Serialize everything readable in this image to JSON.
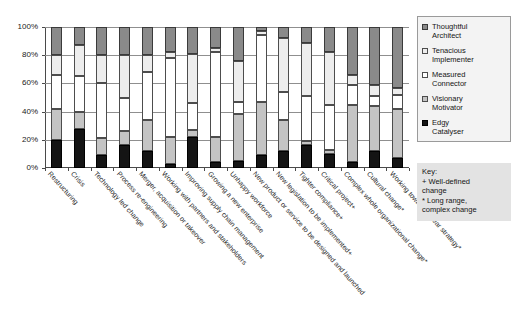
{
  "chart_data": {
    "type": "bar",
    "stacked": true,
    "normalized_percent": true,
    "title": "",
    "xlabel": "",
    "ylabel": "",
    "ylim": [
      0,
      100
    ],
    "ytick_labels": [
      "0%",
      "20%",
      "40%",
      "60%",
      "80%",
      "100%"
    ],
    "ytick_values": [
      0,
      20,
      40,
      60,
      80,
      100
    ],
    "grid": true,
    "legend_position": "right",
    "categories": [
      "Restructuring",
      "Crisis",
      "Technology led change",
      "Process re-engineering",
      "Merger, acquisition or takeover",
      "Working with partners and stakeholders",
      "Improving supply chain management",
      "Growing a new enterprise",
      "Unhappy workforce",
      "New product or service to be designed and launched",
      "New legislation to be implemented+",
      "Tighter compliance+",
      "Critical project+",
      "Complex whole organizational change*",
      "Cultural change*",
      "Working towards 5 year strategy*"
    ],
    "series": [
      {
        "name": "Edgy Catalyser",
        "color": "#141414",
        "values": [
          20,
          28,
          9,
          16,
          12,
          3,
          22,
          4,
          5,
          9,
          12,
          16,
          10,
          4,
          12,
          7
        ]
      },
      {
        "name": "Visionary Motivator",
        "color": "#c4c4c4",
        "values": [
          22,
          12,
          12,
          10,
          22,
          19,
          5,
          18,
          33,
          38,
          22,
          3,
          3,
          41,
          32,
          35
        ]
      },
      {
        "name": "Measured Connector",
        "color": "#ffffff",
        "values": [
          24,
          25,
          39,
          24,
          34,
          56,
          19,
          60,
          9,
          47,
          20,
          32,
          32,
          14,
          7,
          10
        ]
      },
      {
        "name": "Tenacious Implementer",
        "color": "#ededed",
        "values": [
          14,
          22,
          20,
          30,
          12,
          4,
          35,
          3,
          29,
          3,
          38,
          38,
          37,
          7,
          8,
          5
        ]
      },
      {
        "name": "Thoughtful Architect",
        "color": "#8a8a8a",
        "values": [
          20,
          13,
          20,
          20,
          20,
          18,
          19,
          15,
          24,
          3,
          8,
          11,
          18,
          34,
          41,
          43
        ]
      }
    ]
  },
  "legend": {
    "items": [
      {
        "label_line1": "Thoughtful",
        "label_line2": "Architect",
        "swatch": "s4"
      },
      {
        "label_line1": "Tenacious",
        "label_line2": "Implementer",
        "swatch": "s3"
      },
      {
        "label_line1": "Measured",
        "label_line2": "Connector",
        "swatch": "s2"
      },
      {
        "label_line1": "Visionary",
        "label_line2": "Motivator",
        "swatch": "s1"
      },
      {
        "label_line1": "Edgy",
        "label_line2": "Catalyser",
        "swatch": "s0"
      }
    ]
  },
  "key_box": {
    "title": "Key:",
    "line1": "+ Well-defined",
    "line2": "change",
    "line3": "* Long range,",
    "line4": "complex change"
  }
}
